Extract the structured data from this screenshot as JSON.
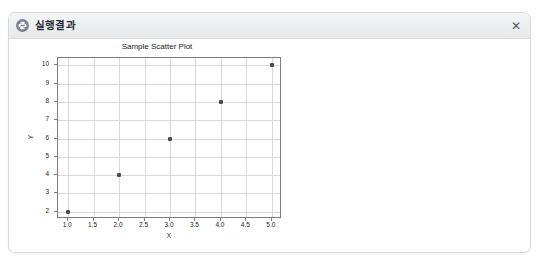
{
  "panel": {
    "title": "실행결과",
    "icon": "python-logo-icon",
    "close_label": "✕"
  },
  "chart_data": {
    "type": "scatter",
    "title": "Sample Scatter Plot",
    "xlabel": "X",
    "ylabel": "Y",
    "x": [
      1,
      2,
      3,
      4,
      5
    ],
    "y": [
      2,
      4,
      6,
      8,
      10
    ],
    "points": [
      {
        "x": 1,
        "y": 2
      },
      {
        "x": 2,
        "y": 4
      },
      {
        "x": 3,
        "y": 6
      },
      {
        "x": 4,
        "y": 8
      },
      {
        "x": 5,
        "y": 10
      }
    ],
    "xlim": [
      0.8,
      5.2
    ],
    "ylim": [
      1.6,
      10.4
    ],
    "xticks": [
      1.0,
      1.5,
      2.0,
      2.5,
      3.0,
      3.5,
      4.0,
      4.5,
      5.0
    ],
    "xtick_labels": [
      "1.0",
      "1.5",
      "2.0",
      "2.5",
      "3.0",
      "3.5",
      "4.0",
      "4.5",
      "5.0"
    ],
    "yticks": [
      2,
      3,
      4,
      5,
      6,
      7,
      8,
      9,
      10
    ],
    "ytick_labels": [
      "2",
      "3",
      "4",
      "5",
      "6",
      "7",
      "8",
      "9",
      "10"
    ],
    "grid": true,
    "legend": null,
    "marker_color": "#4c4c4c",
    "grid_color": "#d9d9d9",
    "frame_color": "#7d7d7d"
  }
}
